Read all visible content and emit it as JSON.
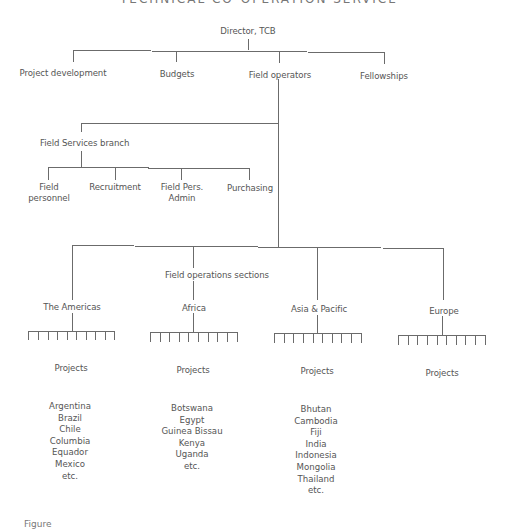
{
  "diagram": {
    "type": "organization-chart",
    "header_clipped": "TECHNICAL CO-OPERATION SERVICE",
    "root": {
      "label": "Director, TCB"
    },
    "level1": [
      {
        "label": "Project development"
      },
      {
        "label": "Budgets"
      },
      {
        "label": "Field operators"
      },
      {
        "label": "Fellowships"
      }
    ],
    "field_services": {
      "label": "Field Services branch",
      "children": [
        {
          "line1": "Field",
          "line2": "personnel"
        },
        {
          "line1": "Recruitment",
          "line2": ""
        },
        {
          "line1": "Field Pers.",
          "line2": "Admin"
        },
        {
          "line1": "Purchasing",
          "line2": ""
        }
      ]
    },
    "field_operations": {
      "label": "Field operations sections",
      "regions": [
        {
          "label": "The Americas",
          "projects_label": "Projects",
          "tick_count": 10,
          "countries": [
            "Argentina",
            "Brazil",
            "Chile",
            "Columbia",
            "Equador",
            "Mexico",
            "etc."
          ]
        },
        {
          "label": "Africa",
          "projects_label": "Projects",
          "tick_count": 10,
          "countries": [
            "Botswana",
            "Egypt",
            "Guinea Bissau",
            "Kenya",
            "Uganda",
            "etc."
          ]
        },
        {
          "label": "Asia & Pacific",
          "projects_label": "Projects",
          "tick_count": 10,
          "countries": [
            "Bhutan",
            "Cambodia",
            "Fiji",
            "India",
            "Indonesia",
            "Mongolia",
            "Thailand",
            "etc."
          ]
        },
        {
          "label": "Europe",
          "projects_label": "Projects",
          "tick_count": 10,
          "countries": []
        }
      ]
    },
    "caption_clipped": "Figure"
  },
  "colors": {
    "line": "#6b6b6b",
    "text": "#555555",
    "background": "#ffffff"
  }
}
